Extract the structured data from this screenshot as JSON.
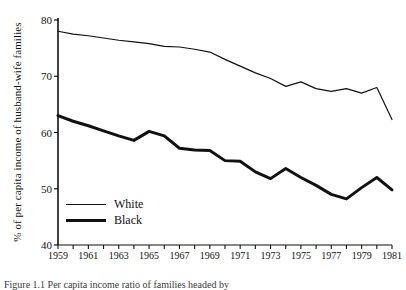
{
  "chart_data": {
    "type": "line",
    "title": "",
    "xlabel": "",
    "ylabel": "% of per capita income of husband-wife families",
    "xlim": [
      1959,
      1981
    ],
    "ylim": [
      40,
      80
    ],
    "yticks": [
      40,
      50,
      60,
      70,
      80
    ],
    "xticks": [
      1959,
      1961,
      1963,
      1965,
      1967,
      1969,
      1971,
      1973,
      1975,
      1977,
      1979,
      1981
    ],
    "xtick_step_years": 2,
    "minor_xticks_every_year": true,
    "grid": false,
    "legend_position": "inside lower-left",
    "x": [
      1959,
      1960,
      1961,
      1962,
      1963,
      1964,
      1965,
      1966,
      1967,
      1968,
      1969,
      1970,
      1971,
      1972,
      1973,
      1974,
      1975,
      1976,
      1977,
      1978,
      1979,
      1980,
      1981
    ],
    "series": [
      {
        "name": "White",
        "color": "#111111",
        "line_width": 1.2,
        "values": [
          78.0,
          77.5,
          77.2,
          76.8,
          76.4,
          76.1,
          75.8,
          75.3,
          75.2,
          74.8,
          74.3,
          73.0,
          71.8,
          70.6,
          69.6,
          68.2,
          69.0,
          67.8,
          67.3,
          67.8,
          67.0,
          68.0,
          62.3
        ]
      },
      {
        "name": "Black",
        "color": "#111111",
        "line_width": 3.0,
        "values": [
          63.0,
          62.0,
          61.2,
          60.3,
          59.4,
          58.6,
          60.2,
          59.4,
          57.2,
          56.9,
          56.8,
          55.0,
          54.9,
          53.0,
          51.8,
          53.6,
          52.0,
          50.6,
          49.0,
          48.2,
          50.2,
          52.0,
          49.8
        ]
      }
    ]
  },
  "legend": {
    "items": [
      {
        "label": "White",
        "style": "thin"
      },
      {
        "label": "Black",
        "style": "thick"
      }
    ]
  },
  "caption": "Figure 1.1 Per capita income ratio of families headed by"
}
